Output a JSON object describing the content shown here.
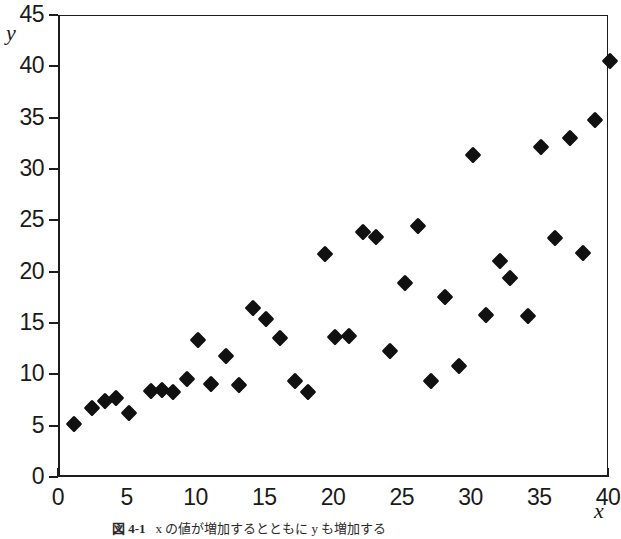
{
  "figure": {
    "background_color": "#ffffff",
    "marker_color": "#111111",
    "axis_color": "#1c1c1c",
    "caption": {
      "number": "図 4-1",
      "text": "x の値が増加するとともに y も増加する"
    }
  },
  "chart_data": {
    "type": "scatter",
    "title": "",
    "xlabel": "x",
    "ylabel": "y",
    "xlim": [
      0,
      40
    ],
    "ylim": [
      0,
      45
    ],
    "xticks": [
      0,
      5,
      10,
      15,
      20,
      25,
      30,
      35,
      40
    ],
    "xticklabels": [
      "0",
      "5",
      "10",
      "15",
      "20",
      "25",
      "30",
      "35",
      "40"
    ],
    "yticks": [
      0,
      5,
      10,
      15,
      20,
      25,
      30,
      35,
      40,
      45
    ],
    "yticklabels": [
      "0",
      "5",
      "10",
      "15",
      "20",
      "25",
      "30",
      "35",
      "40",
      "45"
    ],
    "grid": false,
    "legend": null,
    "marker": "diamond",
    "points": [
      {
        "x": 1.0,
        "y": 5.3
      },
      {
        "x": 2.3,
        "y": 6.8
      },
      {
        "x": 3.3,
        "y": 7.5
      },
      {
        "x": 4.1,
        "y": 7.8
      },
      {
        "x": 5.0,
        "y": 6.3
      },
      {
        "x": 6.6,
        "y": 8.5
      },
      {
        "x": 7.4,
        "y": 8.6
      },
      {
        "x": 8.2,
        "y": 8.4
      },
      {
        "x": 9.2,
        "y": 9.6
      },
      {
        "x": 10.0,
        "y": 13.4
      },
      {
        "x": 11.0,
        "y": 9.2
      },
      {
        "x": 12.1,
        "y": 11.9
      },
      {
        "x": 13.0,
        "y": 9.1
      },
      {
        "x": 14.0,
        "y": 16.6
      },
      {
        "x": 15.0,
        "y": 15.5
      },
      {
        "x": 16.0,
        "y": 13.6
      },
      {
        "x": 17.1,
        "y": 9.4
      },
      {
        "x": 18.0,
        "y": 8.4
      },
      {
        "x": 19.3,
        "y": 21.8
      },
      {
        "x": 20.0,
        "y": 13.7
      },
      {
        "x": 21.0,
        "y": 13.8
      },
      {
        "x": 22.0,
        "y": 24.0
      },
      {
        "x": 23.0,
        "y": 23.5
      },
      {
        "x": 24.0,
        "y": 12.4
      },
      {
        "x": 25.1,
        "y": 19.0
      },
      {
        "x": 26.0,
        "y": 24.5
      },
      {
        "x": 27.0,
        "y": 9.4
      },
      {
        "x": 28.0,
        "y": 17.6
      },
      {
        "x": 29.0,
        "y": 10.9
      },
      {
        "x": 30.0,
        "y": 31.5
      },
      {
        "x": 31.0,
        "y": 15.9
      },
      {
        "x": 32.0,
        "y": 21.1
      },
      {
        "x": 32.7,
        "y": 19.5
      },
      {
        "x": 34.0,
        "y": 15.8
      },
      {
        "x": 35.0,
        "y": 32.2
      },
      {
        "x": 36.0,
        "y": 23.4
      },
      {
        "x": 37.1,
        "y": 33.1
      },
      {
        "x": 38.0,
        "y": 21.9
      },
      {
        "x": 38.9,
        "y": 34.9
      },
      {
        "x": 40.0,
        "y": 40.6
      }
    ]
  }
}
